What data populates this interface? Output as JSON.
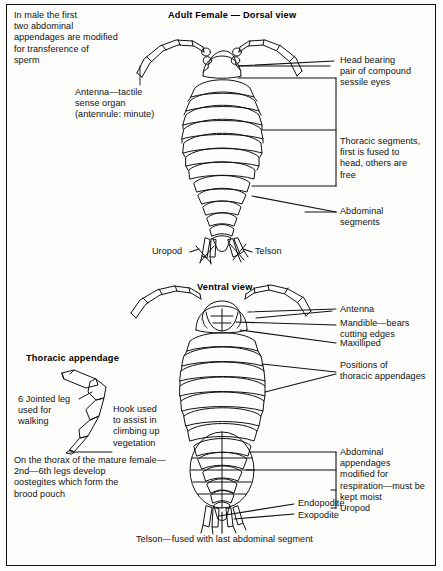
{
  "figure": {
    "titles": {
      "dorsal": "Adult Female — Dorsal view",
      "ventral": "Ventral view",
      "appendage": "Thoracic appendage"
    }
  },
  "dorsal": {
    "note_male": "In male the first\ntwo abdominal\nappendages are modified\nfor transference of\nsperm",
    "antenna": "Antenna—tactile\nsense organ\n(antennule: minute)",
    "head": "Head bearing\npair of compound\nsessile eyes",
    "thoracic_segments": "Thoracic segments,\nfirst is fused to\nhead, others are\nfree",
    "abdominal_segments": "Abdominal\nsegments",
    "uropod": "Uropod",
    "telson": "Telson"
  },
  "ventral": {
    "antenna": "Antenna",
    "mandible": "Mandible—bears\ncutting edges",
    "maxilliped": "Maxilliped",
    "thoracic_appendage_positions": "Positions of\nthoracic appendages",
    "abdominal_appendages": "Abdominal\nappendages\nmodified for\nrespiration—must be\nkept moist",
    "uropod": "Uropod",
    "endopodite": "Endopodite",
    "exopodite": "Exopodite",
    "telson": "Telson—fused with last abdominal segment",
    "brood_pouch": "On the thorax of the mature female—\n2nd—6th legs develop\noostegites which form the\nbrood pouch"
  },
  "appendage": {
    "leg": "6 Jointed leg\nused for\nwalking",
    "hook": "Hook used\nto assist in\nclimbing up\nvegetation"
  },
  "colors": {
    "ink": "#111111",
    "paper": "#fdfdfb",
    "border": "#111111"
  }
}
